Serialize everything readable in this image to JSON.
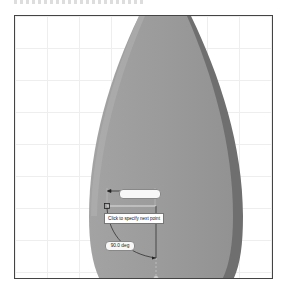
{
  "viewport": {
    "type": "cad-drawing-area",
    "grid": true,
    "colors": {
      "background": "#ffffff",
      "grid_line": "#eeeeee",
      "shape_face": "#9a9a9a",
      "shape_edge": "#6f6f6f",
      "frame": "#444444"
    }
  },
  "shape": {
    "name": "teardrop-solid"
  },
  "dynamic_input": {
    "dimension_value": "",
    "tooltip": "Click to specify next point",
    "angle": "90.0 deg"
  }
}
